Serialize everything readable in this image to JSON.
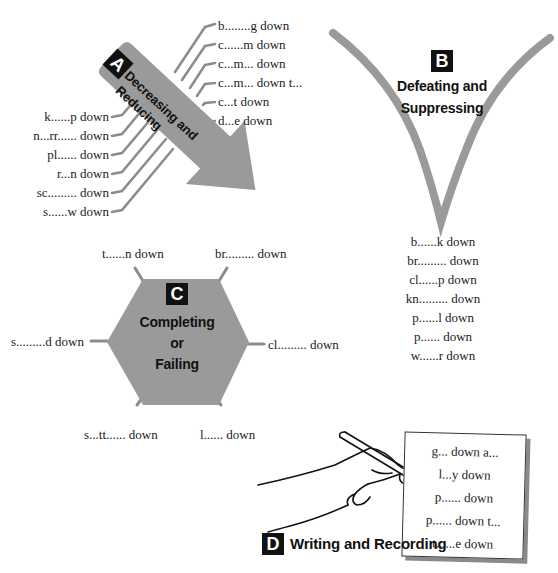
{
  "page_top_text": "",
  "sections": {
    "A": {
      "badge": "A",
      "title_line1": "Decreasing and",
      "title_line2": "Reducing",
      "right_items": [
        "b........g down",
        "c......m down",
        "c...m... down",
        "c...m... down t...",
        "c...t down",
        "d...e down"
      ],
      "left_items": [
        "k......p down",
        "n...rr...... down",
        "pl...... down",
        "r...n down",
        "sc......... down",
        "s......w down"
      ]
    },
    "B": {
      "badge": "B",
      "title_line1": "Defeating and",
      "title_line2": "Suppressing",
      "items": [
        "b......k down",
        "br......... down",
        "cl......p down",
        "kn......... down",
        "p......l down",
        "p...... down",
        "w......r down"
      ]
    },
    "C": {
      "badge": "C",
      "title_line1": "Completing",
      "title_line2": "or",
      "title_line3": "Failing",
      "items": {
        "top_left": "t......n down",
        "top_right": "br......... down",
        "left": "s.........d down",
        "right": "cl......... down",
        "bottom_left": "s...tt...... down",
        "bottom_right": "l...... down"
      }
    },
    "D": {
      "badge": "D",
      "title": "Writing and Recording",
      "items": [
        "g... down a...",
        "l...y down",
        "p...... down",
        "p...... down t...",
        "t......e down"
      ]
    }
  },
  "colors": {
    "shape_gray": "#9a9a9a",
    "line_gray": "#8c8c8c",
    "badge_black": "#111111",
    "text": "#222222"
  }
}
